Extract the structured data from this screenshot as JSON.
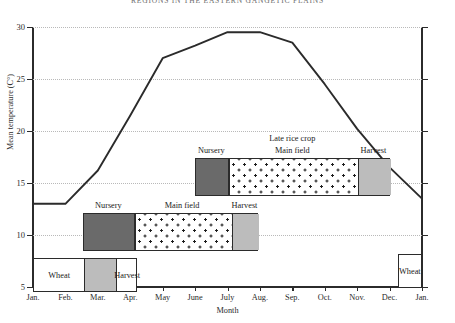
{
  "figure": {
    "clipped_title": "REGIONS IN THE EASTERN GANGETIC PLAINS"
  },
  "chart_data": {
    "type": "line",
    "title": "",
    "xlabel": "Month",
    "ylabel": "Mean temperature (C°)",
    "ylim": [
      5,
      30
    ],
    "yticks": [
      5,
      10,
      15,
      20,
      25,
      30
    ],
    "ytick_labels": [
      "5",
      "10",
      "15",
      "20",
      "25",
      "30"
    ],
    "grid": true,
    "grid_axis": "y",
    "legend": "none",
    "categories": [
      "Jan.",
      "Feb.",
      "Mar.",
      "Apr.",
      "May",
      "June",
      "July",
      "Aug.",
      "Sep.",
      "Oct.",
      "Nov.",
      "Dec.",
      "Jan."
    ],
    "series": [
      {
        "name": "Mean temperature",
        "values": [
          13.0,
          13.0,
          16.2,
          21.5,
          27.0,
          28.2,
          29.5,
          29.5,
          28.5,
          24.5,
          20.2,
          16.5,
          13.5
        ]
      }
    ],
    "annotations": [
      {
        "name": "late-rice-crop",
        "label": "Late rice crop",
        "y_value": 15.6,
        "segments": [
          {
            "name": "Nursery",
            "start_month": "June",
            "end_month": "July"
          },
          {
            "name": "Main field",
            "start_month": "July",
            "end_month": "Nov."
          },
          {
            "name": "Harvest",
            "start_month": "Nov.",
            "end_month": "Dec."
          }
        ]
      },
      {
        "name": "early-rice-crop",
        "label": "",
        "y_value": 10.3,
        "segments": [
          {
            "name": "Nursery",
            "start_month": "Feb.",
            "end_month": "Apr."
          },
          {
            "name": "Main field",
            "start_month": "Apr.",
            "end_month": "July"
          },
          {
            "name": "Harvest",
            "start_month": "July",
            "end_month": "Aug."
          }
        ]
      },
      {
        "name": "wheat-left",
        "label": "Wheat",
        "sub_label": "Harvest",
        "y_value": 6.2,
        "start_month": "Jan.",
        "end_month": "Apr."
      },
      {
        "name": "wheat-right",
        "label": "Wheat",
        "y_value": 6.5,
        "start_month": "Dec.",
        "end_month": "Jan."
      }
    ]
  },
  "labels": {
    "late_rice_crop": "Late rice crop",
    "nursery": "Nursery",
    "main_field": "Main field",
    "harvest": "Harvest",
    "wheat": "Wheat"
  },
  "colors": {
    "nursery": "#6a6a6a",
    "main_field": "#ffffff",
    "harvest": "#bcbcbc",
    "line": "#2b2b2b",
    "grid": "#b9b9b9",
    "axis": "#2b2b2b"
  }
}
